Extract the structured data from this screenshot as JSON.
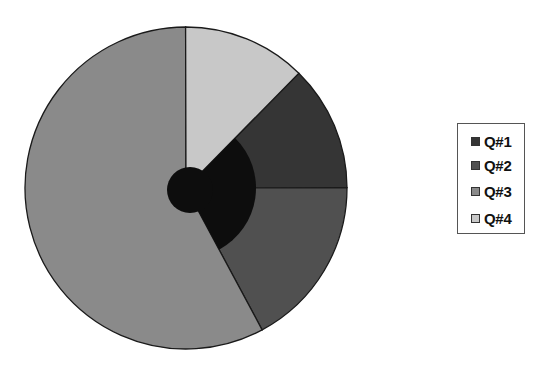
{
  "chart_data": {
    "type": "pie",
    "title": "",
    "categories": [
      "Q#1",
      "Q#2",
      "Q#3",
      "Q#4"
    ],
    "values": [
      12.6,
      17.2,
      57.8,
      12.4
    ],
    "unit": "percent (estimated from slice angles)",
    "start_angle_deg_clockwise_from_top": 44.5,
    "direction": "clockwise",
    "colors": [
      "#353535",
      "#505050",
      "#8a8a8a",
      "#c8c8c8"
    ],
    "legend_position": "right",
    "annotations": [
      "dark circle overlay near pie center",
      "dark inner wedge overlay spanning Q#1 and Q#2 regions"
    ]
  },
  "legend": {
    "items": [
      {
        "label": "Q#1",
        "color": "#353535"
      },
      {
        "label": "Q#2",
        "color": "#505050"
      },
      {
        "label": "Q#3",
        "color": "#8a8a8a"
      },
      {
        "label": "Q#4",
        "color": "#c8c8c8"
      }
    ]
  }
}
